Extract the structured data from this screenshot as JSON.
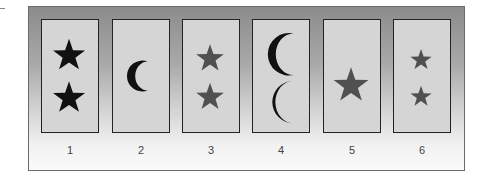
{
  "figure": {
    "colors": {
      "black_shape": "#111111",
      "gray_shape": "#505050",
      "card_fill": "#d5d5d5",
      "card_border": "#222222"
    },
    "cards": [
      {
        "label": "1",
        "symbol": "star",
        "count": 2,
        "color": "black",
        "size": "large"
      },
      {
        "label": "2",
        "symbol": "crescent",
        "count": 1,
        "color": "black",
        "size": "medium"
      },
      {
        "label": "3",
        "symbol": "star",
        "count": 2,
        "color": "gray",
        "size": "medium"
      },
      {
        "label": "4",
        "symbol": "crescent",
        "count": 2,
        "color": "black",
        "size": "large"
      },
      {
        "label": "5",
        "symbol": "star",
        "count": 1,
        "color": "gray",
        "size": "large"
      },
      {
        "label": "6",
        "symbol": "star",
        "count": 2,
        "color": "gray",
        "size": "small"
      }
    ]
  }
}
